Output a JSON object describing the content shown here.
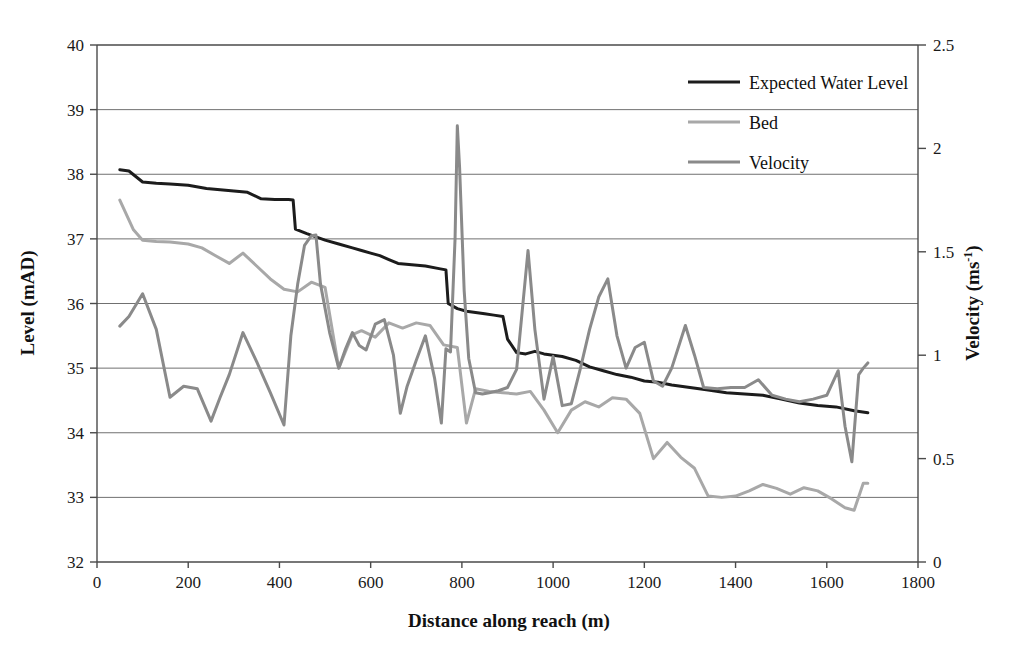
{
  "chart_data": {
    "type": "line",
    "title": "",
    "xlabel": "Distance along reach (m)",
    "ylabel": "Level (mAD)",
    "y2label": "Velocity (ms-1)",
    "y2label_base": "Velocity (ms",
    "y2label_exp": "-1",
    "y2label_close": ")",
    "xlim": [
      0,
      1800
    ],
    "ylim": [
      32,
      40
    ],
    "y2lim": [
      0,
      2.5
    ],
    "xticks": [
      "0",
      "200",
      "400",
      "600",
      "800",
      "1000",
      "1200",
      "1400",
      "1600",
      "1800"
    ],
    "xtick_values": [
      0,
      200,
      400,
      600,
      800,
      1000,
      1200,
      1400,
      1600,
      1800
    ],
    "yticks": [
      "32",
      "33",
      "34",
      "35",
      "36",
      "37",
      "38",
      "39",
      "40"
    ],
    "ytick_values": [
      32,
      33,
      34,
      35,
      36,
      37,
      38,
      39,
      40
    ],
    "y2ticks": [
      "0",
      "0.5",
      "1",
      "1.5",
      "2",
      "2.5"
    ],
    "y2tick_values": [
      0,
      0.5,
      1,
      1.5,
      2,
      2.5
    ],
    "grid": "horizontal",
    "legend_position": "top-right",
    "series": [
      {
        "name": "Expected Water Level",
        "axis": "left",
        "color": "#1c1c1c",
        "width": 3.0,
        "x": [
          50,
          70,
          100,
          130,
          160,
          200,
          240,
          270,
          300,
          330,
          360,
          390,
          420,
          430,
          435,
          460,
          480,
          500,
          530,
          560,
          580,
          600,
          620,
          640,
          660,
          690,
          720,
          750,
          765,
          770,
          790,
          810,
          830,
          850,
          870,
          890,
          900,
          920,
          940,
          960,
          980,
          1000,
          1020,
          1050,
          1080,
          1110,
          1140,
          1170,
          1200,
          1230,
          1260,
          1300,
          1340,
          1380,
          1420,
          1460,
          1500,
          1540,
          1580,
          1620,
          1660,
          1690
        ],
        "y": [
          38.07,
          38.05,
          37.88,
          37.86,
          37.85,
          37.83,
          37.78,
          37.76,
          37.74,
          37.72,
          37.62,
          37.61,
          37.61,
          37.6,
          37.15,
          37.08,
          37.03,
          36.98,
          36.92,
          36.86,
          36.82,
          36.78,
          36.74,
          36.68,
          36.62,
          36.6,
          36.58,
          36.54,
          36.52,
          36.0,
          35.92,
          35.88,
          35.86,
          35.84,
          35.82,
          35.8,
          35.45,
          35.24,
          35.22,
          35.26,
          35.22,
          35.2,
          35.18,
          35.12,
          35.02,
          34.96,
          34.9,
          34.86,
          34.8,
          34.78,
          34.74,
          34.7,
          34.66,
          34.62,
          34.6,
          34.58,
          34.52,
          34.46,
          34.42,
          34.4,
          34.34,
          34.31
        ]
      },
      {
        "name": "Bed",
        "axis": "left",
        "color": "#a8a8a8",
        "width": 3.0,
        "x": [
          50,
          80,
          100,
          130,
          160,
          200,
          230,
          260,
          290,
          320,
          350,
          380,
          410,
          440,
          470,
          500,
          530,
          560,
          580,
          610,
          640,
          670,
          700,
          730,
          760,
          790,
          810,
          830,
          860,
          890,
          920,
          950,
          980,
          1010,
          1040,
          1070,
          1100,
          1130,
          1160,
          1190,
          1220,
          1250,
          1280,
          1310,
          1340,
          1370,
          1400,
          1430,
          1460,
          1490,
          1520,
          1550,
          1580,
          1610,
          1640,
          1660,
          1680,
          1690
        ],
        "y": [
          37.6,
          37.14,
          36.98,
          36.96,
          36.95,
          36.92,
          36.86,
          36.74,
          36.62,
          36.78,
          36.58,
          36.38,
          36.22,
          36.18,
          36.33,
          36.25,
          35.0,
          35.52,
          35.58,
          35.48,
          35.7,
          35.62,
          35.7,
          35.66,
          35.36,
          35.32,
          34.15,
          34.68,
          34.64,
          34.62,
          34.6,
          34.64,
          34.35,
          34.0,
          34.35,
          34.48,
          34.4,
          34.54,
          34.52,
          34.3,
          33.6,
          33.85,
          33.62,
          33.45,
          33.02,
          33.0,
          33.02,
          33.1,
          33.2,
          33.14,
          33.05,
          33.15,
          33.1,
          32.98,
          32.84,
          32.8,
          33.22,
          33.22
        ]
      },
      {
        "name": "Velocity",
        "axis": "right",
        "color": "#8a8a8a",
        "width": 3.0,
        "x": [
          50,
          70,
          100,
          130,
          160,
          190,
          220,
          250,
          270,
          290,
          320,
          350,
          380,
          410,
          425,
          440,
          455,
          470,
          480,
          490,
          510,
          530,
          545,
          560,
          575,
          590,
          610,
          630,
          650,
          665,
          680,
          700,
          720,
          740,
          755,
          765,
          775,
          785,
          790,
          795,
          805,
          815,
          830,
          845,
          860,
          880,
          900,
          920,
          945,
          960,
          980,
          1000,
          1020,
          1040,
          1060,
          1080,
          1100,
          1120,
          1140,
          1160,
          1180,
          1200,
          1220,
          1240,
          1260,
          1290,
          1310,
          1330,
          1360,
          1390,
          1420,
          1450,
          1480,
          1510,
          1540,
          1570,
          1600,
          1625,
          1640,
          1655,
          1670,
          1680,
          1690
        ],
        "y": [
          35.65,
          35.8,
          36.15,
          35.6,
          34.55,
          34.72,
          34.68,
          34.18,
          34.55,
          34.9,
          35.55,
          35.1,
          34.62,
          34.12,
          35.5,
          36.3,
          36.9,
          37.05,
          37.06,
          36.3,
          35.55,
          35.0,
          35.3,
          35.55,
          35.35,
          35.28,
          35.68,
          35.75,
          35.2,
          34.3,
          34.72,
          35.12,
          35.5,
          34.85,
          34.15,
          35.3,
          35.25,
          37.0,
          38.75,
          38.1,
          36.2,
          35.15,
          34.62,
          34.6,
          34.62,
          34.65,
          34.7,
          34.98,
          36.82,
          35.6,
          34.52,
          35.18,
          34.42,
          34.45,
          35.0,
          35.6,
          36.1,
          36.38,
          35.5,
          35.0,
          35.32,
          35.4,
          34.8,
          34.72,
          35.0,
          35.66,
          35.2,
          34.7,
          34.68,
          34.7,
          34.7,
          34.82,
          34.58,
          34.52,
          34.48,
          34.52,
          34.58,
          34.96,
          34.1,
          33.55,
          34.9,
          35.0,
          35.08
        ]
      }
    ],
    "legend": [
      {
        "label": "Expected Water Level",
        "color": "#1c1c1c",
        "width": 3.2
      },
      {
        "label": "Bed",
        "color": "#a8a8a8",
        "width": 3.2
      },
      {
        "label": "Velocity",
        "color": "#8a8a8a",
        "width": 3.2
      }
    ]
  },
  "axes": {
    "left_title": "Level (mAD)",
    "bottom_title": "Distance along reach (m)",
    "right_title_base": "Velocity (ms",
    "right_title_exp": "-1",
    "right_title_close": ")"
  }
}
